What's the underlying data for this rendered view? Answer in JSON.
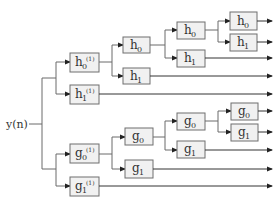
{
  "diagram": {
    "input_label": "y(n)",
    "branches": {
      "h": {
        "level1": [
          {
            "base": "h",
            "sub": "0",
            "sup": "(1)"
          },
          {
            "base": "h",
            "sub": "1",
            "sup": "(1)"
          }
        ],
        "level2": [
          {
            "base": "h",
            "sub": "0"
          },
          {
            "base": "h",
            "sub": "1"
          }
        ],
        "level3": [
          {
            "base": "h",
            "sub": "0"
          },
          {
            "base": "h",
            "sub": "1"
          }
        ],
        "level4": [
          {
            "base": "h",
            "sub": "0"
          },
          {
            "base": "h",
            "sub": "1"
          }
        ]
      },
      "g": {
        "level1": [
          {
            "base": "g",
            "sub": "0",
            "sup": "(1)"
          },
          {
            "base": "g",
            "sub": "1",
            "sup": "(1)"
          }
        ],
        "level2": [
          {
            "base": "g",
            "sub": "0"
          },
          {
            "base": "g",
            "sub": "1"
          }
        ],
        "level3": [
          {
            "base": "g",
            "sub": "0"
          },
          {
            "base": "g",
            "sub": "1"
          }
        ],
        "level4": [
          {
            "base": "g",
            "sub": "0"
          },
          {
            "base": "g",
            "sub": "1"
          }
        ]
      }
    },
    "outputs_count": 10,
    "colors": {
      "box_fill": "#f1f1f1",
      "box_stroke": "#6e6e6e",
      "wire": "#6a6a6a",
      "arrow": "#222222",
      "text": "#333333"
    }
  }
}
